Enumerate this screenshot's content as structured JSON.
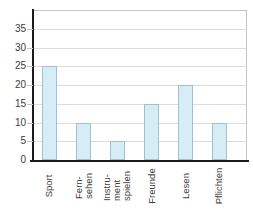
{
  "chart_data": {
    "type": "bar",
    "title": "",
    "categories": [
      "Sport",
      "Fern-\nsehen",
      "Instru-\nment\nspielen",
      "Freunde",
      "Lesen",
      "Pflichten"
    ],
    "values": [
      25,
      10,
      5,
      15,
      20,
      10
    ],
    "xlabel": "",
    "ylabel": "",
    "ylim": [
      0,
      40
    ],
    "yticks": [
      0,
      5,
      10,
      15,
      20,
      25,
      30,
      35
    ],
    "grid": true,
    "legend": "none",
    "colors": {
      "bar_fill": "#d7edf5",
      "bar_border": "#a4c0cb",
      "axis": "#1c1c1c",
      "gridline": "#dcdcdc",
      "frame": "#c4c4c4",
      "text": "#3c3c3c",
      "background": "#ffffff"
    }
  }
}
